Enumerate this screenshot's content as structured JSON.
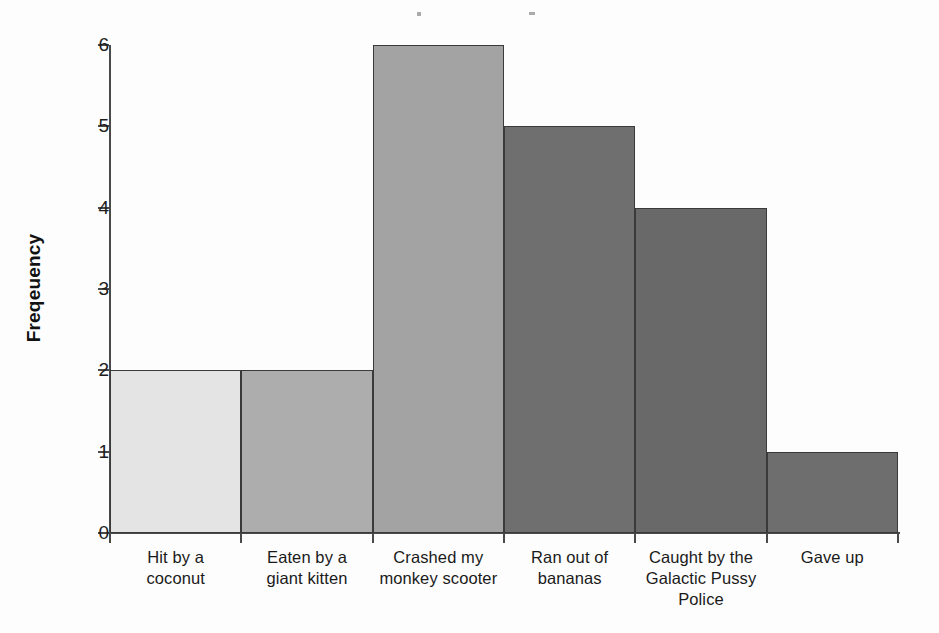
{
  "chart_data": {
    "type": "bar",
    "title": "",
    "xlabel": "",
    "ylabel": "Freqeuency",
    "ylim": [
      0,
      6
    ],
    "yticks": [
      "0",
      "1",
      "2",
      "3",
      "4",
      "5",
      "6"
    ],
    "grid": false,
    "legend": null,
    "categories": [
      "Hit by a coconut",
      "Eaten by a giant kitten",
      "Crashed my monkey scooter",
      "Ran out of bananas",
      "Caught by the Galactic Pussy Police",
      "Gave up"
    ],
    "category_lines": [
      [
        "Hit by a",
        "coconut"
      ],
      [
        "Eaten by a",
        "giant kitten"
      ],
      [
        "Crashed my",
        "monkey scooter"
      ],
      [
        "Ran out of",
        "bananas"
      ],
      [
        "Caught by the",
        "Galactic Pussy",
        "Police"
      ],
      [
        "Gave up"
      ]
    ],
    "values": [
      2,
      2,
      6,
      5,
      4,
      1
    ],
    "bar_colors": [
      "#e4e4e4",
      "#adadad",
      "#a3a3a3",
      "#6f6f6f",
      "#696969",
      "#6e6e6e"
    ],
    "bar_edge_color": "#3a3a3a",
    "axis_color": "#4a4a4a"
  },
  "axis": {
    "y_title": "Freqeuency",
    "y_ticks": [
      "6",
      "5",
      "4",
      "3",
      "2",
      "1",
      "0"
    ]
  }
}
